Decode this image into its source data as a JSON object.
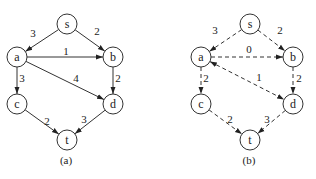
{
  "graphs": [
    {
      "id": "a",
      "caption": "(a)",
      "style": "solid",
      "nodes": [
        {
          "id": "s",
          "label": "s",
          "x": 67,
          "y": 24
        },
        {
          "id": "a",
          "label": "a",
          "x": 17,
          "y": 57
        },
        {
          "id": "b",
          "label": "b",
          "x": 113,
          "y": 57
        },
        {
          "id": "c",
          "label": "c",
          "x": 17,
          "y": 104
        },
        {
          "id": "d",
          "label": "d",
          "x": 113,
          "y": 104
        },
        {
          "id": "t",
          "label": "t",
          "x": 67,
          "y": 140
        }
      ],
      "edges": [
        {
          "from": "s",
          "to": "a",
          "weight": "3",
          "lx": 33,
          "ly": 33,
          "arrow_end": true,
          "arrow_start": false
        },
        {
          "from": "s",
          "to": "b",
          "weight": "2",
          "lx": 97,
          "ly": 31,
          "arrow_end": true,
          "arrow_start": false
        },
        {
          "from": "a",
          "to": "b",
          "weight": "1",
          "lx": 66,
          "ly": 51,
          "arrow_end": true,
          "arrow_start": false
        },
        {
          "from": "a",
          "to": "d",
          "weight": "4",
          "lx": 76,
          "ly": 78,
          "arrow_end": true,
          "arrow_start": false
        },
        {
          "from": "a",
          "to": "c",
          "weight": "3",
          "lx": 22,
          "ly": 78,
          "arrow_end": true,
          "arrow_start": false
        },
        {
          "from": "b",
          "to": "d",
          "weight": "2",
          "lx": 118,
          "ly": 78,
          "arrow_end": true,
          "arrow_start": false
        },
        {
          "from": "c",
          "to": "t",
          "weight": "2",
          "lx": 47,
          "ly": 121,
          "arrow_end": true,
          "arrow_start": false
        },
        {
          "from": "d",
          "to": "t",
          "weight": "3",
          "lx": 84,
          "ly": 119,
          "arrow_end": true,
          "arrow_start": false
        }
      ]
    },
    {
      "id": "b",
      "caption": "(b)",
      "style": "dashed",
      "nodes": [
        {
          "id": "s",
          "label": "s",
          "x": 250,
          "y": 24
        },
        {
          "id": "a",
          "label": "a",
          "x": 201,
          "y": 57
        },
        {
          "id": "b",
          "label": "b",
          "x": 293,
          "y": 57
        },
        {
          "id": "c",
          "label": "c",
          "x": 201,
          "y": 104
        },
        {
          "id": "d",
          "label": "d",
          "x": 293,
          "y": 104
        },
        {
          "id": "t",
          "label": "t",
          "x": 250,
          "y": 140
        }
      ],
      "edges": [
        {
          "from": "s",
          "to": "a",
          "weight": "3",
          "lx": 215,
          "ly": 30,
          "arrow_end": true,
          "arrow_start": false
        },
        {
          "from": "s",
          "to": "b",
          "weight": "2",
          "lx": 280,
          "ly": 30,
          "arrow_end": true,
          "arrow_start": false
        },
        {
          "from": "a",
          "to": "b",
          "weight": "0",
          "lx": 249,
          "ly": 49,
          "arrow_end": true,
          "arrow_start": false
        },
        {
          "from": "a",
          "to": "d",
          "weight": "1",
          "lx": 259,
          "ly": 77,
          "arrow_end": true,
          "arrow_start": true
        },
        {
          "from": "a",
          "to": "c",
          "weight": "2",
          "lx": 206,
          "ly": 78,
          "arrow_end": true,
          "arrow_start": false
        },
        {
          "from": "b",
          "to": "d",
          "weight": "2",
          "lx": 299,
          "ly": 78,
          "arrow_end": true,
          "arrow_start": false
        },
        {
          "from": "c",
          "to": "t",
          "weight": "2",
          "lx": 230,
          "ly": 119,
          "arrow_end": true,
          "arrow_start": false
        },
        {
          "from": "d",
          "to": "t",
          "weight": "3",
          "lx": 267,
          "ly": 119,
          "arrow_end": true,
          "arrow_start": false
        }
      ]
    }
  ],
  "colors": {
    "stroke": "#333333",
    "text": "#222222",
    "background": "#ffffff"
  }
}
